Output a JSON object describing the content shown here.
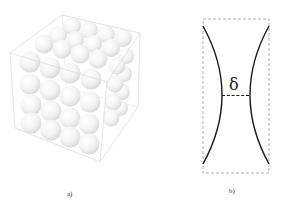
{
  "panels": [
    {
      "id": "a",
      "label": "a)",
      "description": "Cubic box packed with spheres (simple cubic arrangement, 4x4x4)",
      "box_color": "#d8d8d8",
      "sphere_grid": {
        "rows": 4,
        "cols": 4,
        "layers": 4
      }
    },
    {
      "id": "b",
      "label": "b)",
      "description": "Neck between two spheres in a dashed bounding box",
      "symbol": "δ",
      "curve_color": "#1a1a1a",
      "box_color": "#999999"
    }
  ]
}
